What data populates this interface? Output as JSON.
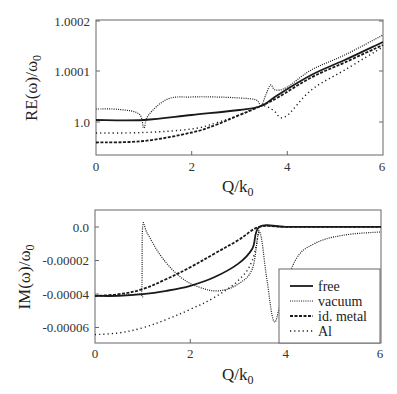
{
  "chart_data": [
    {
      "type": "line",
      "title": "",
      "xlabel": "Q/k0",
      "ylabel": "RE(ω)/ω0",
      "xlim": [
        0,
        6
      ],
      "ylim": [
        0.99993,
        1.0002
      ],
      "xticks": [
        "0",
        "2",
        "4",
        "6"
      ],
      "yticks": [
        {
          "value": 1.0,
          "label": "1.0"
        },
        {
          "value": 1.0001,
          "label": "1.0001"
        },
        {
          "value": 1.0002,
          "label": "1.0002"
        }
      ],
      "grid": false,
      "legend_position": "none",
      "series": [
        {
          "name": "free",
          "style": "solid",
          "x": [
            0,
            1,
            2,
            3,
            3.45,
            3.8,
            4.5,
            5.2,
            6
          ],
          "y": [
            1.0,
            1.0,
            1.00001,
            1.00002,
            1.000028,
            1.00005,
            1.00009,
            1.00012,
            1.000156
          ]
        },
        {
          "name": "vacuum",
          "style": "fine-dotted",
          "x": [
            0,
            0.5,
            0.9,
            1.0,
            1.1,
            1.5,
            2.0,
            2.5,
            3.0,
            3.35,
            3.45,
            3.55,
            3.65,
            3.75,
            4.0,
            4.5,
            5.2,
            6
          ],
          "y": [
            1.000022,
            1.000021,
            1.000012,
            0.999984,
            1.00001,
            1.000042,
            1.000046,
            1.000046,
            1.000044,
            1.00004,
            1.000028,
            1.00005,
            1.00007,
            1.00006,
            1.000066,
            1.0001,
            1.00013,
            1.00017
          ]
        },
        {
          "name": "id. metal",
          "style": "dashed",
          "x": [
            0,
            1,
            2,
            2.5,
            3,
            3.45,
            3.8,
            4.5,
            5.2,
            6
          ],
          "y": [
            0.999955,
            0.999958,
            0.999975,
            0.99999,
            1.00001,
            1.000028,
            1.000045,
            1.000085,
            1.000115,
            1.00015
          ]
        },
        {
          "name": "Al",
          "style": "coarse-dotted",
          "x": [
            0,
            1,
            2,
            2.5,
            3,
            3.45,
            3.7,
            3.95,
            4.5,
            5.2,
            6
          ],
          "y": [
            0.999974,
            0.999975,
            0.999982,
            0.999994,
            1.00001,
            1.000028,
            1.00002,
            1.000006,
            1.00006,
            1.0001,
            1.000146
          ]
        }
      ]
    },
    {
      "type": "line",
      "title": "",
      "xlabel": "Q/k0",
      "ylabel": "IM(ω)/ω0",
      "xlim": [
        0,
        6
      ],
      "ylim": [
        -6.9e-05,
        1e-05
      ],
      "xticks": [
        "0",
        "2",
        "4",
        "6"
      ],
      "yticks": [
        {
          "value": 0.0,
          "label": "0.0"
        },
        {
          "value": -2e-05,
          "label": "-0.00002"
        },
        {
          "value": -4e-05,
          "label": "-0.00004"
        },
        {
          "value": -6e-05,
          "label": "-0.00006"
        }
      ],
      "grid": false,
      "legend_position": "lower right",
      "series": [
        {
          "name": "free",
          "style": "solid",
          "x": [
            0,
            0.5,
            1,
            1.5,
            2,
            2.5,
            3,
            3.3,
            3.45,
            4,
            5,
            6
          ],
          "y": [
            -4.1e-05,
            -4.1e-05,
            -4e-05,
            -3.8e-05,
            -3.5e-05,
            -3e-05,
            -2.2e-05,
            -1.3e-05,
            0.0,
            0.0,
            0.0,
            0.0
          ]
        },
        {
          "name": "vacuum",
          "style": "fine-dotted",
          "x": [
            0,
            0.9,
            0.98,
            1.0,
            1.1,
            1.4,
            1.8,
            2.2,
            2.6,
            3.0,
            3.3,
            3.45,
            3.6,
            3.75,
            3.9,
            4.2,
            4.6,
            5.2,
            6
          ],
          "y": [
            -4.1e-05,
            -4e-05,
            -3.8e-05,
            0.0,
            -4e-06,
            -1.8e-05,
            -3e-05,
            -3.6e-05,
            -3.8e-05,
            -3.4e-05,
            -2.5e-05,
            -3e-06,
            -3e-05,
            -5.6e-05,
            -4.5e-05,
            -2e-05,
            -1e-05,
            -5e-06,
            -3e-06
          ]
        },
        {
          "name": "id. metal",
          "style": "dashed",
          "x": [
            0,
            0.5,
            1,
            1.5,
            2,
            2.5,
            3,
            3.45,
            4,
            5,
            6
          ],
          "y": [
            -4.1e-05,
            -4e-05,
            -3.7e-05,
            -3.1e-05,
            -2.4e-05,
            -1.6e-05,
            -8e-06,
            0.0,
            0.0,
            0.0,
            0.0
          ]
        },
        {
          "name": "Al",
          "style": "coarse-dotted",
          "x": [
            0,
            0.5,
            1,
            1.5,
            2,
            2.5,
            3,
            3.3,
            3.45
          ],
          "y": [
            -6.4e-05,
            -6.3e-05,
            -6e-05,
            -5.5e-05,
            -4.9e-05,
            -4.2e-05,
            -3.2e-05,
            -2e-05,
            0.0
          ]
        }
      ],
      "legend": [
        "free",
        "vacuum",
        "id. metal",
        "Al"
      ]
    }
  ],
  "panels": {
    "top": {
      "ylabel_text": "RE(ω)/ω",
      "ylabel_sub": "0",
      "xlabel_text": "Q/k",
      "xlabel_sub": "0",
      "yticks": [
        "1.0002",
        "1.0001",
        "1.0"
      ],
      "xticks": [
        "0",
        "2",
        "4",
        "6"
      ]
    },
    "bottom": {
      "ylabel_text": "IM(ω)/ω",
      "ylabel_sub": "0",
      "xlabel_text": "Q/k",
      "xlabel_sub": "0",
      "yticks": [
        "0.0",
        "-0.00002",
        "-0.00004",
        "-0.00006"
      ],
      "xticks": [
        "0",
        "2",
        "4",
        "6"
      ]
    }
  },
  "legend": {
    "items": [
      "free",
      "vacuum",
      "id. metal",
      "Al"
    ]
  },
  "colors": {
    "line": "#1a1a1a",
    "axis": "#555555"
  }
}
